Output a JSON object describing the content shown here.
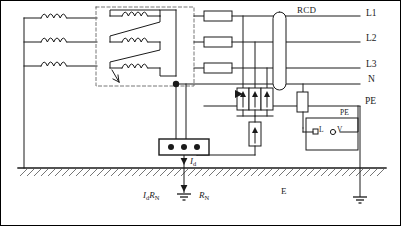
{
  "diagram": {
    "type": "electrical-single-line-diagram",
    "colors": {
      "line": "#1a1a1a",
      "ground_hatch": "#555555",
      "background": "#ffffff",
      "border": "#000000",
      "dashed": "#777777"
    }
  },
  "rails": [
    {
      "id": "L1",
      "label": "L1",
      "y": 14
    },
    {
      "id": "L2",
      "label": "L2",
      "y": 38
    },
    {
      "id": "L3",
      "label": "L3",
      "y": 62
    },
    {
      "id": "N",
      "label": "N",
      "y": 82
    },
    {
      "id": "PE",
      "label": "PE",
      "y": 104
    }
  ],
  "components": {
    "primary_windings": {
      "count": 3,
      "name": "transformer-primary-coils"
    },
    "secondary_windings": {
      "count": 3,
      "name": "transformer-secondary-coils",
      "connection": "delta"
    },
    "dashed_enclosure": {
      "name": "transformer-enclosure",
      "style": "dashed"
    },
    "fuses": {
      "count": 3,
      "on_rails": [
        "L1",
        "L2",
        "L3"
      ]
    },
    "rcd": {
      "label": "RCD",
      "shape": "toroid",
      "spans": [
        "L1",
        "N"
      ]
    },
    "surge_arresters_line": {
      "count": 3,
      "symbol": "arrow-up-in-box"
    },
    "surge_arrester_neutral": {
      "count": 1,
      "symbol": "arrow-up-in-box"
    },
    "pe_device": {
      "symbol": "vertical-box",
      "on_rail": "PE"
    },
    "terminal_block": {
      "terminals": 3,
      "name": "neutral-terminal-block"
    },
    "appliance": {
      "pe_label": "PE",
      "terminal_l": "L",
      "terminal_v": "V",
      "name": "appliance-box"
    },
    "earth_electrodes": {
      "count": 2,
      "names": [
        "neutral-earth-electrode",
        "installation-earth-electrode"
      ]
    }
  },
  "annotations": {
    "fault_current": {
      "symbol": "I",
      "subscript": "d"
    },
    "touch_voltage": {
      "symbol": "I",
      "subscript": "d",
      "symbol2": "R",
      "subscript2": "N"
    },
    "earth_resistance": {
      "symbol": "R",
      "subscript": "N"
    },
    "earth_label": "E",
    "pe_near_appliance": "PE"
  }
}
